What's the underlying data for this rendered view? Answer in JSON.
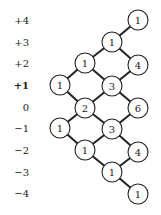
{
  "diagram": {
    "type": "lattice-path-count",
    "row_labels": [
      {
        "text": "+4",
        "y": 20,
        "bold": false
      },
      {
        "text": "+3",
        "y": 42,
        "bold": false
      },
      {
        "text": "+2",
        "y": 63,
        "bold": false
      },
      {
        "text": "+1",
        "y": 85,
        "bold": true
      },
      {
        "text": "0",
        "y": 107,
        "bold": false
      },
      {
        "text": "−1",
        "y": 128,
        "bold": false
      },
      {
        "text": "−2",
        "y": 150,
        "bold": false
      },
      {
        "text": "−3",
        "y": 172,
        "bold": false
      },
      {
        "text": "−4",
        "y": 193,
        "bold": false
      }
    ],
    "nodes": [
      {
        "id": "a",
        "value": "1",
        "x": 138,
        "y": 20
      },
      {
        "id": "b",
        "value": "1",
        "x": 112,
        "y": 42
      },
      {
        "id": "c",
        "value": "1",
        "x": 85,
        "y": 63
      },
      {
        "id": "d",
        "value": "4",
        "x": 138,
        "y": 65
      },
      {
        "id": "e",
        "value": "1",
        "x": 60,
        "y": 85
      },
      {
        "id": "f",
        "value": "3",
        "x": 112,
        "y": 86
      },
      {
        "id": "g",
        "value": "2",
        "x": 85,
        "y": 108
      },
      {
        "id": "h",
        "value": "6",
        "x": 138,
        "y": 108
      },
      {
        "id": "i",
        "value": "1",
        "x": 60,
        "y": 128
      },
      {
        "id": "j",
        "value": "3",
        "x": 112,
        "y": 129
      },
      {
        "id": "k",
        "value": "1",
        "x": 85,
        "y": 150
      },
      {
        "id": "l",
        "value": "4",
        "x": 138,
        "y": 152
      },
      {
        "id": "m",
        "value": "1",
        "x": 112,
        "y": 172
      },
      {
        "id": "n",
        "value": "1",
        "x": 138,
        "y": 194
      }
    ],
    "edges": [
      [
        "a",
        "b"
      ],
      [
        "b",
        "c"
      ],
      [
        "b",
        "d"
      ],
      [
        "c",
        "e"
      ],
      [
        "c",
        "f"
      ],
      [
        "d",
        "f"
      ],
      [
        "e",
        "g"
      ],
      [
        "f",
        "g"
      ],
      [
        "f",
        "h"
      ],
      [
        "g",
        "i"
      ],
      [
        "g",
        "j"
      ],
      [
        "h",
        "j"
      ],
      [
        "i",
        "k"
      ],
      [
        "j",
        "k"
      ],
      [
        "j",
        "l"
      ],
      [
        "k",
        "m"
      ],
      [
        "l",
        "m"
      ],
      [
        "m",
        "n"
      ]
    ],
    "colors": {
      "stroke": "#222222",
      "fill": "#ffffff"
    }
  }
}
